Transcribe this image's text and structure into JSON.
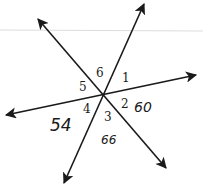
{
  "diagram": {
    "type": "intersecting-lines",
    "intersection": {
      "x": 103,
      "y": 95
    },
    "lines": [
      {
        "id": "line-a",
        "from": [
          38,
          19
        ],
        "to": [
          166,
          168
        ],
        "arrows": "both"
      },
      {
        "id": "line-b",
        "from": [
          144,
          4
        ],
        "to": [
          64,
          183
        ],
        "arrows": "both"
      },
      {
        "id": "line-c",
        "from": [
          6,
          115
        ],
        "to": [
          196,
          75
        ],
        "arrows": "both"
      }
    ],
    "angle_labels": [
      {
        "label": "1",
        "x": 122,
        "y": 82
      },
      {
        "label": "2",
        "x": 121,
        "y": 108
      },
      {
        "label": "3",
        "x": 104,
        "y": 121
      },
      {
        "label": "4",
        "x": 83,
        "y": 113
      },
      {
        "label": "5",
        "x": 79,
        "y": 91
      },
      {
        "label": "6",
        "x": 96,
        "y": 77
      }
    ],
    "handwritten_values": [
      {
        "text": "60",
        "x": 134,
        "y": 112,
        "size": 14
      },
      {
        "text": "54",
        "x": 50,
        "y": 131,
        "size": 17
      },
      {
        "text": "66",
        "x": 101,
        "y": 144,
        "size": 12
      }
    ],
    "faint_rule": {
      "y": 30
    }
  }
}
